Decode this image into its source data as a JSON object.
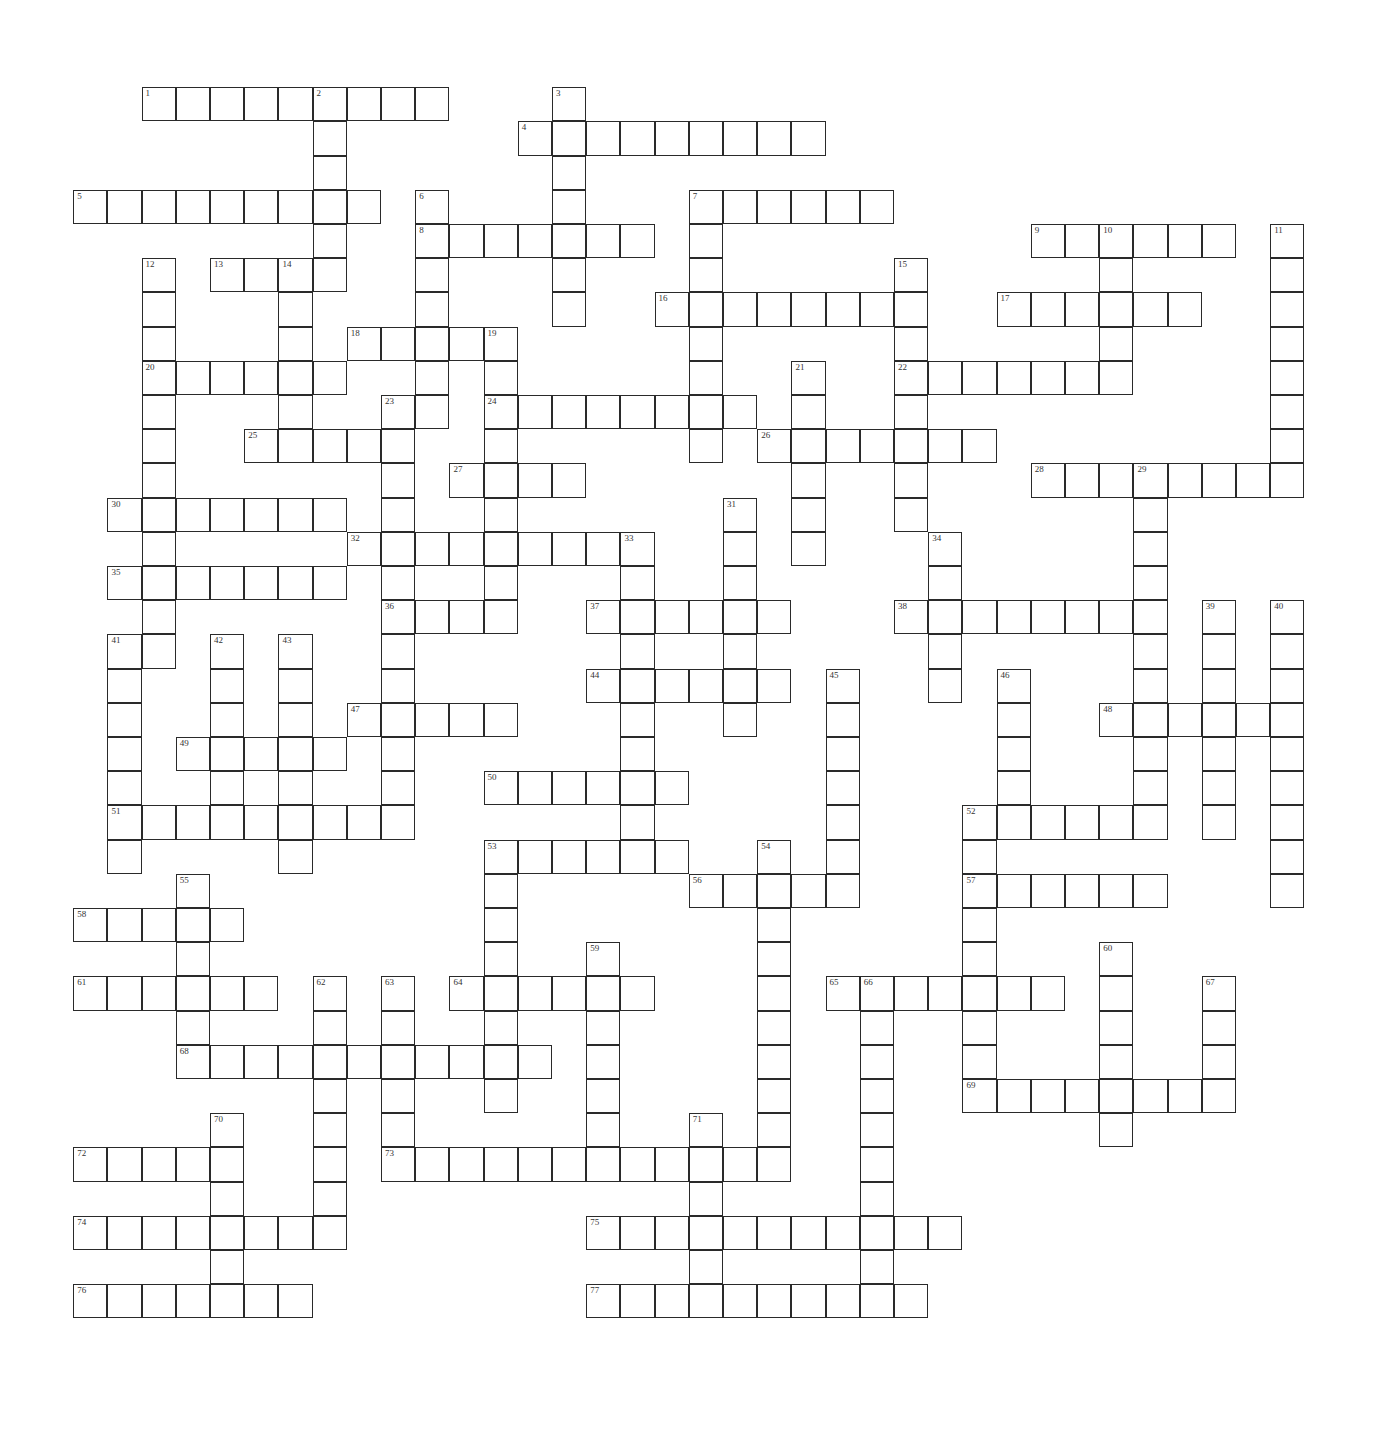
{
  "puzzle": {
    "cell_size": 34.2,
    "shaded": [
      [
        5,
        20
      ]
    ],
    "words": [
      {
        "num": 1,
        "dir": "across",
        "col": 2,
        "row": 0,
        "len": 9
      },
      {
        "num": 2,
        "dir": "down",
        "col": 7,
        "row": 0,
        "len": 6
      },
      {
        "num": 3,
        "dir": "down",
        "col": 14,
        "row": 0,
        "len": 7
      },
      {
        "num": 4,
        "dir": "across",
        "col": 13,
        "row": 1,
        "len": 9
      },
      {
        "num": 5,
        "dir": "across",
        "col": 0,
        "row": 3,
        "len": 9
      },
      {
        "num": 6,
        "dir": "down",
        "col": 10,
        "row": 3,
        "len": 7
      },
      {
        "num": 7,
        "dir": "across",
        "col": 18,
        "row": 3,
        "len": 6
      },
      {
        "num": 7,
        "dir": "down",
        "col": 18,
        "row": 3,
        "len": 8
      },
      {
        "num": 8,
        "dir": "across",
        "col": 10,
        "row": 4,
        "len": 7
      },
      {
        "num": 9,
        "dir": "across",
        "col": 28,
        "row": 4,
        "len": 6
      },
      {
        "num": 10,
        "dir": "down",
        "col": 30,
        "row": 4,
        "len": 5
      },
      {
        "num": 11,
        "dir": "down",
        "col": 35,
        "row": 4,
        "len": 8
      },
      {
        "num": 12,
        "dir": "down",
        "col": 2,
        "row": 5,
        "len": 12
      },
      {
        "num": 13,
        "dir": "across",
        "col": 4,
        "row": 5,
        "len": 4
      },
      {
        "num": 14,
        "dir": "down",
        "col": 6,
        "row": 5,
        "len": 6
      },
      {
        "num": 15,
        "dir": "down",
        "col": 24,
        "row": 5,
        "len": 8
      },
      {
        "num": 16,
        "dir": "across",
        "col": 17,
        "row": 6,
        "len": 8
      },
      {
        "num": 17,
        "dir": "across",
        "col": 27,
        "row": 6,
        "len": 6
      },
      {
        "num": 18,
        "dir": "across",
        "col": 8,
        "row": 7,
        "len": 5
      },
      {
        "num": 19,
        "dir": "down",
        "col": 12,
        "row": 7,
        "len": 9
      },
      {
        "num": 20,
        "dir": "across",
        "col": 2,
        "row": 8,
        "len": 6
      },
      {
        "num": 21,
        "dir": "down",
        "col": 21,
        "row": 8,
        "len": 6
      },
      {
        "num": 22,
        "dir": "across",
        "col": 24,
        "row": 8,
        "len": 7
      },
      {
        "num": 23,
        "dir": "down",
        "col": 9,
        "row": 9,
        "len": 13
      },
      {
        "num": 24,
        "dir": "across",
        "col": 12,
        "row": 9,
        "len": 8
      },
      {
        "num": 25,
        "dir": "across",
        "col": 5,
        "row": 10,
        "len": 5
      },
      {
        "num": 26,
        "dir": "across",
        "col": 20,
        "row": 10,
        "len": 7
      },
      {
        "num": 27,
        "dir": "across",
        "col": 11,
        "row": 11,
        "len": 4
      },
      {
        "num": 28,
        "dir": "across",
        "col": 28,
        "row": 11,
        "len": 8
      },
      {
        "num": 29,
        "dir": "down",
        "col": 31,
        "row": 11,
        "len": 11
      },
      {
        "num": 30,
        "dir": "across",
        "col": 1,
        "row": 12,
        "len": 7
      },
      {
        "num": 31,
        "dir": "down",
        "col": 19,
        "row": 12,
        "len": 7
      },
      {
        "num": 32,
        "dir": "across",
        "col": 8,
        "row": 13,
        "len": 9
      },
      {
        "num": 33,
        "dir": "down",
        "col": 16,
        "row": 13,
        "len": 10
      },
      {
        "num": 34,
        "dir": "down",
        "col": 25,
        "row": 13,
        "len": 5
      },
      {
        "num": 35,
        "dir": "across",
        "col": 1,
        "row": 14,
        "len": 7
      },
      {
        "num": 36,
        "dir": "across",
        "col": 9,
        "row": 15,
        "len": 4
      },
      {
        "num": 37,
        "dir": "across",
        "col": 15,
        "row": 15,
        "len": 6
      },
      {
        "num": 38,
        "dir": "across",
        "col": 24,
        "row": 15,
        "len": 8
      },
      {
        "num": 39,
        "dir": "down",
        "col": 33,
        "row": 15,
        "len": 7
      },
      {
        "num": 40,
        "dir": "down",
        "col": 35,
        "row": 15,
        "len": 9
      },
      {
        "num": 41,
        "dir": "down",
        "col": 1,
        "row": 16,
        "len": 7
      },
      {
        "num": 42,
        "dir": "down",
        "col": 4,
        "row": 16,
        "len": 5
      },
      {
        "num": 43,
        "dir": "down",
        "col": 6,
        "row": 16,
        "len": 7
      },
      {
        "num": 44,
        "dir": "across",
        "col": 15,
        "row": 17,
        "len": 6
      },
      {
        "num": 45,
        "dir": "down",
        "col": 22,
        "row": 17,
        "len": 7
      },
      {
        "num": 46,
        "dir": "down",
        "col": 27,
        "row": 17,
        "len": 4
      },
      {
        "num": 47,
        "dir": "across",
        "col": 8,
        "row": 18,
        "len": 5
      },
      {
        "num": 48,
        "dir": "across",
        "col": 30,
        "row": 18,
        "len": 6
      },
      {
        "num": 49,
        "dir": "across",
        "col": 3,
        "row": 19,
        "len": 5
      },
      {
        "num": 50,
        "dir": "across",
        "col": 12,
        "row": 20,
        "len": 6
      },
      {
        "num": 51,
        "dir": "across",
        "col": 1,
        "row": 21,
        "len": 9
      },
      {
        "num": 52,
        "dir": "across",
        "col": 26,
        "row": 21,
        "len": 6
      },
      {
        "num": 52,
        "dir": "down",
        "col": 26,
        "row": 21,
        "len": 9
      },
      {
        "num": 53,
        "dir": "across",
        "col": 12,
        "row": 22,
        "len": 6
      },
      {
        "num": 53,
        "dir": "down",
        "col": 12,
        "row": 22,
        "len": 8
      },
      {
        "num": 54,
        "dir": "down",
        "col": 20,
        "row": 22,
        "len": 10
      },
      {
        "num": 55,
        "dir": "down",
        "col": 3,
        "row": 23,
        "len": 6
      },
      {
        "num": 56,
        "dir": "across",
        "col": 18,
        "row": 23,
        "len": 5
      },
      {
        "num": 57,
        "dir": "across",
        "col": 26,
        "row": 23,
        "len": 6
      },
      {
        "num": 58,
        "dir": "across",
        "col": 0,
        "row": 24,
        "len": 5
      },
      {
        "num": 59,
        "dir": "down",
        "col": 15,
        "row": 25,
        "len": 7
      },
      {
        "num": 60,
        "dir": "down",
        "col": 30,
        "row": 25,
        "len": 6
      },
      {
        "num": 61,
        "dir": "across",
        "col": 0,
        "row": 26,
        "len": 6
      },
      {
        "num": 62,
        "dir": "down",
        "col": 7,
        "row": 26,
        "len": 7
      },
      {
        "num": 63,
        "dir": "down",
        "col": 9,
        "row": 26,
        "len": 6
      },
      {
        "num": 64,
        "dir": "across",
        "col": 11,
        "row": 26,
        "len": 6
      },
      {
        "num": 65,
        "dir": "across",
        "col": 22,
        "row": 26,
        "len": 7
      },
      {
        "num": 66,
        "dir": "down",
        "col": 23,
        "row": 26,
        "len": 10
      },
      {
        "num": 67,
        "dir": "down",
        "col": 33,
        "row": 26,
        "len": 4
      },
      {
        "num": 68,
        "dir": "across",
        "col": 3,
        "row": 28,
        "len": 11
      },
      {
        "num": 69,
        "dir": "across",
        "col": 26,
        "row": 29,
        "len": 8
      },
      {
        "num": 70,
        "dir": "down",
        "col": 4,
        "row": 30,
        "len": 5
      },
      {
        "num": 71,
        "dir": "down",
        "col": 18,
        "row": 30,
        "len": 6
      },
      {
        "num": 72,
        "dir": "across",
        "col": 0,
        "row": 31,
        "len": 5
      },
      {
        "num": 73,
        "dir": "across",
        "col": 9,
        "row": 31,
        "len": 12
      },
      {
        "num": 74,
        "dir": "across",
        "col": 0,
        "row": 33,
        "len": 8
      },
      {
        "num": 75,
        "dir": "across",
        "col": 15,
        "row": 33,
        "len": 11
      },
      {
        "num": 76,
        "dir": "across",
        "col": 0,
        "row": 35,
        "len": 7
      },
      {
        "num": 77,
        "dir": "across",
        "col": 15,
        "row": 35,
        "len": 10
      }
    ]
  }
}
